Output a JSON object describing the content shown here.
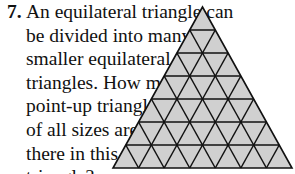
{
  "problem": {
    "number": "7.",
    "lines": [
      "An equilateral triangle can",
      "be divided into many",
      "smaller equilateral",
      "triangles. How many",
      "point-up triangles",
      "of all sizes are",
      "there in this",
      "triangle?"
    ]
  },
  "figure": {
    "type": "triangular-grid",
    "rows": 7,
    "fill_color": "#d0d0d0",
    "line_color": "#111111",
    "apex": [
      202.5,
      7
    ],
    "base_left": [
      113,
      168
    ],
    "base_right": [
      292,
      168
    ]
  }
}
